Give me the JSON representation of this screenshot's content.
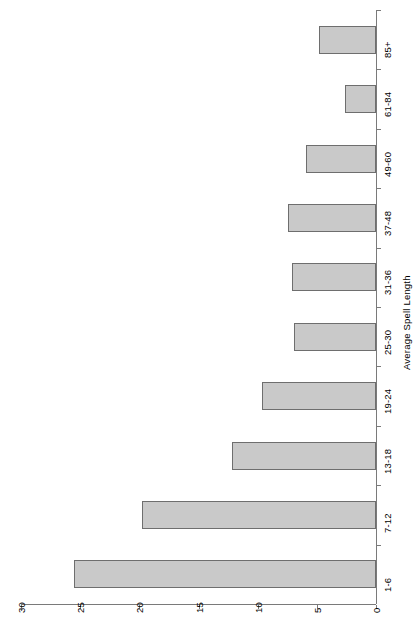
{
  "chart_data": {
    "type": "bar",
    "orientation": "horizontal",
    "title": "",
    "subtitle": "",
    "xlabel": "",
    "ylabel": "Average Spell Length",
    "categories": [
      "1-6",
      "7-12",
      "13-18",
      "19-24",
      "25-30",
      "31-36",
      "37-48",
      "49-60",
      "61-84",
      "85+"
    ],
    "values": [
      25.5,
      19.8,
      12.2,
      9.6,
      6.9,
      7.1,
      7.4,
      5.9,
      2.6,
      4.8
    ],
    "value_axis_ticks": [
      30,
      25,
      20,
      15,
      10,
      5,
      0
    ],
    "value_axis_tick_labels": [
      "30",
      "25",
      "20",
      "15",
      "10",
      "5",
      "0"
    ],
    "xlim": [
      30,
      0
    ],
    "value_axis_reversed": true,
    "grid": false,
    "legend": null,
    "legend_position": "none",
    "bar_fill_color": "#c9c9c9",
    "bar_border_color": "#6e6e6e",
    "axis_color": "#7a7a7a",
    "rotation_note": "entire plot rendered rotated 90 degrees"
  },
  "axis_title": "Average Spell Length"
}
